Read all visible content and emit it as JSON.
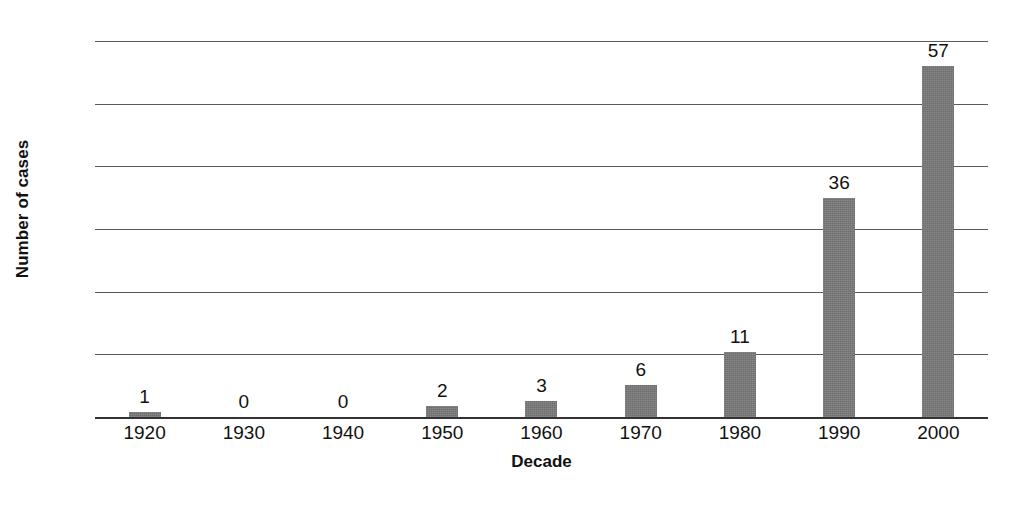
{
  "chart_data": {
    "type": "bar",
    "title": "",
    "xlabel": "Decade",
    "ylabel": "Number of cases",
    "categories": [
      "1920",
      "1930",
      "1940",
      "1950",
      "1960",
      "1970",
      "1980",
      "1990",
      "2000"
    ],
    "values": [
      1,
      0,
      0,
      2,
      3,
      6,
      11,
      36,
      57
    ],
    "bar_heights": [
      0.8,
      0,
      0,
      1.8,
      2.5,
      5.1,
      10.3,
      35.0,
      56.0
    ],
    "data_labels": [
      "1",
      "0",
      "0",
      "2",
      "3",
      "6",
      "11",
      "36",
      "57"
    ],
    "ylim": [
      0,
      60
    ],
    "yticks": [
      0,
      10,
      20,
      30,
      40,
      50,
      60
    ],
    "ytick_labels": [
      "0",
      "10",
      "20",
      "30",
      "40",
      "50",
      "60"
    ],
    "grid": true,
    "legend": "none",
    "bar_color": "#6e6e6e",
    "gridline_color": "#5a5a5a",
    "axis_color": "#333333",
    "text_color": "#111111",
    "background_color": "#ffffff"
  }
}
